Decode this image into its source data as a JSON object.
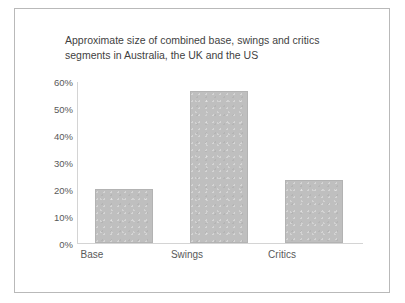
{
  "chart_data": {
    "type": "bar",
    "title": "Approximate size of combined base, swings and critics\nsegments in Australia, the UK and the US",
    "categories": [
      "Base",
      "Swings",
      "Critics"
    ],
    "values": [
      20,
      56.5,
      23.5
    ],
    "tick_labels": [
      "0%",
      "10%",
      "20%",
      "30%",
      "40%",
      "50%",
      "60%"
    ],
    "tick_values": [
      0,
      10,
      20,
      30,
      40,
      50,
      60
    ],
    "ylim": [
      0,
      60
    ],
    "xlabel": "",
    "ylabel": "",
    "grid": false,
    "legend": "none",
    "bar_color": "#bfbfbf",
    "axis_color": "#d4d4d4",
    "text_color": "#595959",
    "title_color": "#3f3f3f"
  }
}
